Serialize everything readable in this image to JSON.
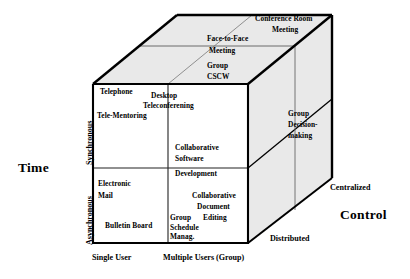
{
  "figure": {
    "type": "3d-cube-taxonomy",
    "title_text": "",
    "colors": {
      "stroke": "#000000",
      "face_front": "#ffffff",
      "face_top": "#e9e9e9",
      "face_right": "#e9e9e9",
      "background": "#ffffff",
      "text": "#000000",
      "thin_line": "#555555"
    }
  },
  "axes": {
    "time": {
      "name": "Time",
      "ticks": [
        {
          "label": "Synchronous"
        },
        {
          "label": "Asynchronous"
        }
      ]
    },
    "users": {
      "name": "",
      "ticks": [
        {
          "label": "Single User"
        },
        {
          "label": "Multiple Users (Group)"
        }
      ]
    },
    "control": {
      "name": "Control",
      "ticks": [
        {
          "label": "Distributed"
        },
        {
          "label": "Centralized"
        }
      ]
    }
  },
  "cells": {
    "front_top_left": [
      {
        "label": "Telephone"
      },
      {
        "label": "Tele-Mentoring"
      }
    ],
    "front_top_right": [
      {
        "label": "Desktop"
      },
      {
        "label": "Teleconferening"
      },
      {
        "label": "Collaborative"
      },
      {
        "label": "Software"
      }
    ],
    "front_bottom_left": [
      {
        "label": "Electronic"
      },
      {
        "label": "Mail"
      },
      {
        "label": "Bulletin Board"
      }
    ],
    "front_bottom_right": [
      {
        "label": "Development"
      },
      {
        "label": "Collaborative"
      },
      {
        "label": "Document"
      },
      {
        "label": "Editing"
      },
      {
        "label": "Group"
      },
      {
        "label": "Schedule"
      },
      {
        "label": "Manag."
      }
    ],
    "top_face": [
      {
        "label": "Conference Room"
      },
      {
        "label": "Meeting"
      },
      {
        "label": "Face-to-Face"
      },
      {
        "label": "Meeting"
      },
      {
        "label": "Group"
      },
      {
        "label": "CSCW"
      }
    ],
    "right_face": [
      {
        "label": "Group"
      },
      {
        "label": "Decision-"
      },
      {
        "label": "making"
      }
    ]
  },
  "text": {
    "telephone": "Telephone",
    "tele_mentoring": "Tele-Mentoring",
    "desktop": "Desktop",
    "teleconferening": "Teleconferening",
    "collaborative_software_1": "Collaborative",
    "collaborative_software_2": "Software",
    "development": "Development",
    "electronic": "Electronic",
    "mail": "Mail",
    "bulletin_board": "Bulletin Board",
    "collab_doc_1": "Collaborative",
    "collab_doc_2": "Document",
    "collab_doc_3": "Editing",
    "group_sched_1": "Group",
    "group_sched_2": "Schedule",
    "group_sched_3": "Manag.",
    "conference_room": "Conference Room",
    "conference_meeting": "Meeting",
    "face_to_face": "Face-to-Face",
    "face_meeting": "Meeting",
    "group_cscw_1": "Group",
    "group_cscw_2": "CSCW",
    "group_decision_1": "Group",
    "group_decision_2": "Decision-",
    "group_decision_3": "making",
    "time_axis": "Time",
    "control_axis": "Control",
    "synchronous": "Synchronous",
    "asynchronous": "Asynchronous",
    "single_user": "Single User",
    "multiple_users": "Multiple Users (Group)",
    "centralized": "Centralized",
    "distributed": "Distributed"
  }
}
